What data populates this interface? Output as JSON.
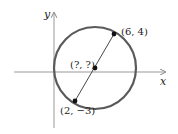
{
  "diagram": {
    "type": "circle-with-diameter",
    "axes": {
      "x_label": "x",
      "y_label": "y"
    },
    "points": [
      {
        "id": "endpoint-top",
        "label": "(6, 4)"
      },
      {
        "id": "center",
        "label": "(?, ?)"
      },
      {
        "id": "endpoint-bottom",
        "label": "(2, −3)"
      }
    ],
    "colors": {
      "circle": "#5a5a5a",
      "axis": "#888888",
      "point": "#111111",
      "text": "#222222"
    }
  }
}
